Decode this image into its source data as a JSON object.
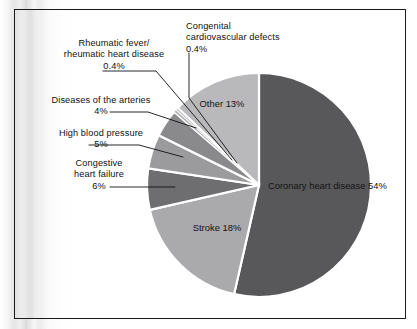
{
  "figure": {
    "type": "pie-chart-figure",
    "background": "#ffffff",
    "frame_color": "#1a1a1a"
  },
  "chart_data": {
    "type": "pie",
    "title": "",
    "subtitle": "",
    "xlabel": "",
    "ylabel": "",
    "legend_position": "none",
    "grid": false,
    "start_angle_deg": 0,
    "direction": "clockwise",
    "categories": [
      "Coronary heart disease",
      "Stroke",
      "Congestive heart failure",
      "High blood pressure",
      "Diseases of the arteries",
      "Rheumatic fever/rheumatic heart disease",
      "Congenital cardiovascular defects",
      "Other"
    ],
    "values": [
      54,
      18,
      6,
      5,
      4,
      0.4,
      0.4,
      13
    ],
    "value_labels": [
      "54%",
      "18%",
      "6%",
      "5%",
      "4%",
      "0.4%",
      "0.4%",
      "13%"
    ],
    "colors": [
      "#58585a",
      "#aaaaac",
      "#6e6e70",
      "#9b9b9d",
      "#8a8a8c",
      "#b4b4b6",
      "#c2c2c4",
      "#b9b9bb"
    ],
    "slice_separator_color": "#ffffff",
    "slices": [
      {
        "name": "Coronary heart disease",
        "value": 54,
        "label": "54%",
        "label_placement": "inside",
        "color": "#58585a"
      },
      {
        "name": "Stroke",
        "value": 18,
        "label": "18%",
        "label_placement": "inside",
        "color": "#aaaaac"
      },
      {
        "name": "Congestive heart failure",
        "value": 6,
        "label": "6%",
        "label_placement": "callout",
        "color": "#6e6e70"
      },
      {
        "name": "High blood pressure",
        "value": 5,
        "label": "5%",
        "label_placement": "callout",
        "color": "#9b9b9d"
      },
      {
        "name": "Diseases of the arteries",
        "value": 4,
        "label": "4%",
        "label_placement": "callout",
        "color": "#8a8a8c"
      },
      {
        "name": "Rheumatic fever/rheumatic heart disease",
        "value": 0.4,
        "label": "0.4%",
        "label_placement": "callout",
        "color": "#b4b4b6"
      },
      {
        "name": "Congenital cardiovascular defects",
        "value": 0.4,
        "label": "0.4%",
        "label_placement": "callout",
        "color": "#c2c2c4"
      },
      {
        "name": "Other",
        "value": 13,
        "label": "13%",
        "label_placement": "inside",
        "color": "#b9b9bb"
      }
    ]
  },
  "callouts": {
    "rheumatic": {
      "line1": "Rheumatic fever/",
      "line2": "rheumatic heart disease",
      "line3": "0.4%"
    },
    "congenital": {
      "line1": "Congenital",
      "line2": "cardiovascular defects",
      "line3": "0.4%"
    },
    "arteries": {
      "line1": "Diseases of the arteries",
      "line2": "4%"
    },
    "high_blood_pressure": {
      "line1": "High blood pressure",
      "line2": "5%"
    },
    "congestive": {
      "line1": "Congestive",
      "line2": "heart failure",
      "line3": "6%"
    }
  },
  "inside_labels": {
    "other": {
      "line1": "Other",
      "line2": "13%"
    },
    "coronary": {
      "line1": "Coronary",
      "line2": "heart disease",
      "line3": "54%"
    },
    "stroke": {
      "line1": "Stroke",
      "line2": "18%"
    }
  }
}
